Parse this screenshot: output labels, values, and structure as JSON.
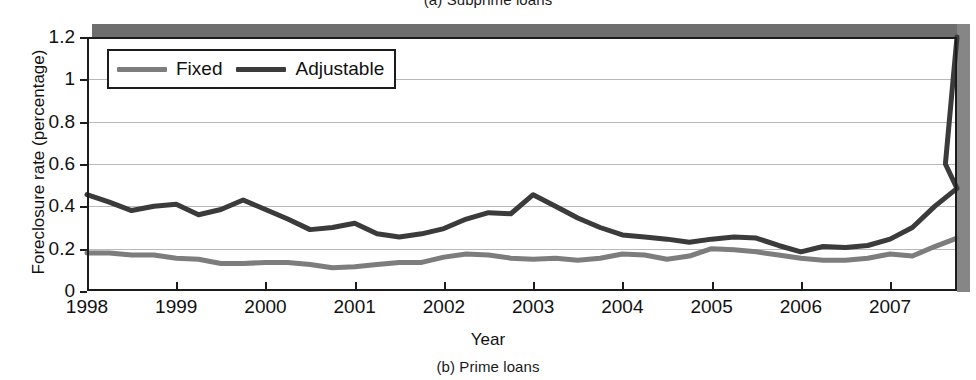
{
  "figure": {
    "caption_top": "(a) Subprime loans",
    "caption_bottom": "(b) Prime loans"
  },
  "chart_data": {
    "type": "line",
    "title": "(a) Subprime loans",
    "subtitle": "(b) Prime loans",
    "xlabel": "Year",
    "ylabel": "Foreclosure rate (percentage)",
    "xlim": [
      1998.0,
      2007.75
    ],
    "ylim": [
      0,
      1.2
    ],
    "yticks": [
      0,
      0.2,
      0.4,
      0.6,
      0.8,
      1,
      1.2
    ],
    "ytick_labels": [
      "0",
      "0.2",
      "0.4",
      "0.6",
      "0.8",
      "1",
      "1.2"
    ],
    "xticks": [
      1998,
      1999,
      2000,
      2001,
      2002,
      2003,
      2004,
      2005,
      2006,
      2007
    ],
    "xtick_labels": [
      "1998",
      "1999",
      "2000",
      "2001",
      "2002",
      "2003",
      "2004",
      "2005",
      "2006",
      "2007"
    ],
    "grid": "horizontal",
    "legend_position": "top-left",
    "colors": {
      "fixed": "#7d7d7d",
      "adjustable": "#3b3b3b",
      "grid": "#b9b9b9",
      "frame": "#1c1c1c"
    },
    "x": [
      1998.0,
      1998.25,
      1998.5,
      1998.75,
      1999.0,
      1999.25,
      1999.5,
      1999.75,
      2000.0,
      2000.25,
      2000.5,
      2000.75,
      2001.0,
      2001.25,
      2001.5,
      2001.75,
      2002.0,
      2002.25,
      2002.5,
      2002.75,
      2003.0,
      2003.25,
      2003.5,
      2003.75,
      2004.0,
      2004.25,
      2004.5,
      2004.75,
      2005.0,
      2005.25,
      2005.5,
      2005.75,
      2006.0,
      2006.25,
      2006.5,
      2006.75,
      2007.0,
      2007.25,
      2007.5,
      2007.75
    ],
    "series": [
      {
        "name": "Fixed",
        "color": "#7d7d7d",
        "values": [
          0.18,
          0.18,
          0.17,
          0.17,
          0.155,
          0.15,
          0.13,
          0.13,
          0.135,
          0.135,
          0.125,
          0.11,
          0.115,
          0.125,
          0.135,
          0.135,
          0.16,
          0.175,
          0.17,
          0.155,
          0.15,
          0.155,
          0.145,
          0.155,
          0.175,
          0.17,
          0.15,
          0.165,
          0.2,
          0.195,
          0.185,
          0.17,
          0.155,
          0.145,
          0.145,
          0.155,
          0.175,
          0.165,
          0.21,
          0.25
        ]
      },
      {
        "name": "Adjustable",
        "color": "#3b3b3b",
        "values": [
          0.455,
          0.42,
          0.38,
          0.4,
          0.41,
          0.36,
          0.385,
          0.43,
          0.385,
          0.34,
          0.29,
          0.3,
          0.32,
          0.27,
          0.255,
          0.27,
          0.295,
          0.34,
          0.37,
          0.365,
          0.455,
          0.4,
          0.345,
          0.3,
          0.265,
          0.255,
          0.245,
          0.23,
          0.245,
          0.255,
          0.25,
          0.215,
          0.185,
          0.21,
          0.205,
          0.215,
          0.245,
          0.3,
          0.4,
          0.485
        ],
        "values_tail_note": "continues 0.60 at 2007.55, 1.20 at 2007.75"
      }
    ],
    "legend": [
      {
        "label": "Fixed",
        "color": "#7d7d7d"
      },
      {
        "label": "Adjustable",
        "color": "#3b3b3b"
      }
    ]
  }
}
